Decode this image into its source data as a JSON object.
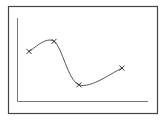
{
  "chart_data": {
    "type": "line",
    "title": "",
    "xlabel": "",
    "ylabel": "",
    "grid": false,
    "legend": null,
    "x": [
      1,
      2,
      3,
      4
    ],
    "series": [
      {
        "name": "series",
        "values": [
          6.0,
          7.2,
          2.0,
          4.0
        ],
        "marker": "x",
        "smooth": true
      }
    ],
    "xlim": [
      0.5,
      5
    ],
    "ylim": [
      0,
      10
    ]
  },
  "colors": {
    "frame": "#444444",
    "axis": "#777777",
    "line": "#555555",
    "marker": "#333333"
  }
}
